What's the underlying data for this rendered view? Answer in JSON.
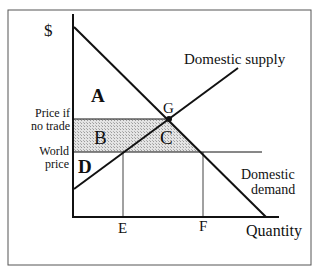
{
  "diagram": {
    "y_axis_label": "$",
    "x_axis_label": "Quantity",
    "curves": {
      "supply_label": "Domestic supply",
      "demand_label_line1": "Domestic",
      "demand_label_line2": "demand"
    },
    "price_levels": {
      "no_trade_line1": "Price if",
      "no_trade_line2": "no trade",
      "world_line1": "World",
      "world_line2": "price"
    },
    "areas": {
      "a": "A",
      "b": "B",
      "c": "C",
      "d": "D"
    },
    "points": {
      "g": "G"
    },
    "quantity_ticks": {
      "e": "E",
      "f": "F"
    },
    "colors": {
      "line": "#111111",
      "shade": "#cfcfcf",
      "frame": "#555555"
    }
  }
}
